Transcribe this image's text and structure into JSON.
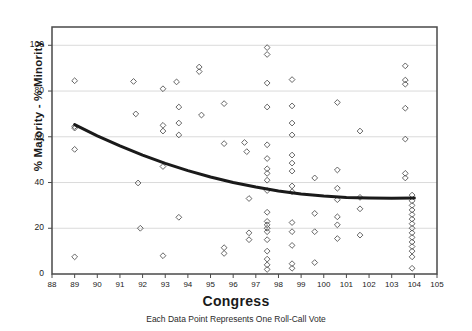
{
  "chart_data": {
    "type": "scatter",
    "title": "",
    "xlabel": "Congress",
    "ylabel": "% Majority - % Minority",
    "caption": "Each Data Point Represents One Roll-Call Vote",
    "xlim": [
      88,
      105
    ],
    "ylim": [
      0,
      108
    ],
    "xticks": [
      88,
      89,
      90,
      91,
      92,
      93,
      94,
      95,
      96,
      97,
      98,
      99,
      100,
      101,
      102,
      103,
      104,
      105
    ],
    "yticks": [
      0,
      20,
      40,
      60,
      80,
      100
    ],
    "grid": "horizontal",
    "legend": "none",
    "marker": "open-diamond",
    "marker_color": "#555555",
    "trend_color": "#1a1a1a",
    "points": [
      [
        89,
        84.5
      ],
      [
        89,
        64.5
      ],
      [
        89,
        63.8
      ],
      [
        89,
        54.5
      ],
      [
        89,
        7.5
      ],
      [
        91.6,
        84.2
      ],
      [
        91.7,
        70.0
      ],
      [
        91.8,
        39.8
      ],
      [
        91.9,
        20.0
      ],
      [
        92.9,
        81.0
      ],
      [
        92.9,
        62.5
      ],
      [
        92.9,
        65.0
      ],
      [
        92.9,
        47.0
      ],
      [
        92.9,
        8.0
      ],
      [
        93.5,
        84.0
      ],
      [
        93.6,
        73.0
      ],
      [
        93.6,
        66.0
      ],
      [
        93.6,
        60.8
      ],
      [
        93.6,
        24.8
      ],
      [
        94.5,
        90.5
      ],
      [
        94.5,
        88.5
      ],
      [
        94.6,
        69.5
      ],
      [
        95.6,
        74.5
      ],
      [
        95.6,
        57.0
      ],
      [
        95.6,
        11.5
      ],
      [
        95.6,
        9.0
      ],
      [
        96.5,
        57.5
      ],
      [
        96.6,
        53.5
      ],
      [
        96.7,
        33.0
      ],
      [
        96.7,
        18.0
      ],
      [
        96.7,
        15.0
      ],
      [
        97.5,
        99.0
      ],
      [
        97.5,
        96.0
      ],
      [
        97.5,
        83.5
      ],
      [
        97.5,
        73.0
      ],
      [
        97.5,
        56.5
      ],
      [
        97.5,
        50.5
      ],
      [
        97.5,
        46.0
      ],
      [
        97.5,
        44.0
      ],
      [
        97.5,
        41.0
      ],
      [
        97.5,
        36.5
      ],
      [
        97.5,
        27.0
      ],
      [
        97.5,
        23.0
      ],
      [
        97.5,
        21.5
      ],
      [
        97.5,
        20.0
      ],
      [
        97.5,
        18.5
      ],
      [
        97.5,
        15.0
      ],
      [
        97.5,
        10.0
      ],
      [
        97.5,
        6.5
      ],
      [
        97.5,
        4.0
      ],
      [
        97.5,
        2.0
      ],
      [
        98.6,
        85.0
      ],
      [
        98.6,
        73.5
      ],
      [
        98.6,
        66.0
      ],
      [
        98.6,
        60.8
      ],
      [
        98.6,
        52.0
      ],
      [
        98.6,
        48.5
      ],
      [
        98.6,
        45.0
      ],
      [
        98.6,
        38.5
      ],
      [
        98.6,
        36.0
      ],
      [
        98.6,
        22.5
      ],
      [
        98.6,
        18.5
      ],
      [
        98.6,
        12.5
      ],
      [
        98.6,
        4.5
      ],
      [
        98.6,
        2.5
      ],
      [
        99.6,
        42.0
      ],
      [
        99.6,
        26.5
      ],
      [
        99.6,
        18.5
      ],
      [
        99.6,
        5.0
      ],
      [
        100.6,
        75.0
      ],
      [
        100.6,
        45.5
      ],
      [
        100.6,
        37.5
      ],
      [
        100.6,
        32.5
      ],
      [
        100.6,
        25.0
      ],
      [
        100.6,
        21.5
      ],
      [
        100.6,
        15.5
      ],
      [
        101.6,
        62.5
      ],
      [
        101.6,
        33.5
      ],
      [
        101.6,
        28.5
      ],
      [
        101.6,
        17.0
      ],
      [
        103.6,
        91.0
      ],
      [
        103.6,
        84.8
      ],
      [
        103.6,
        83.0
      ],
      [
        103.6,
        72.5
      ],
      [
        103.6,
        59.0
      ],
      [
        103.6,
        44.0
      ],
      [
        103.6,
        42.0
      ],
      [
        103.9,
        34.5
      ],
      [
        103.9,
        32.0
      ],
      [
        103.9,
        30.0
      ],
      [
        103.9,
        28.0
      ],
      [
        103.9,
        26.0
      ],
      [
        103.9,
        24.0
      ],
      [
        103.9,
        22.0
      ],
      [
        103.9,
        20.0
      ],
      [
        103.9,
        18.0
      ],
      [
        103.9,
        16.0
      ],
      [
        103.9,
        14.0
      ],
      [
        103.9,
        12.0
      ],
      [
        103.9,
        10.0
      ],
      [
        103.9,
        7.5
      ],
      [
        103.9,
        2.5
      ]
    ],
    "trend_line": [
      [
        89.0,
        65.3
      ],
      [
        90.0,
        60.4
      ],
      [
        91.0,
        56.0
      ],
      [
        92.0,
        52.0
      ],
      [
        93.0,
        48.4
      ],
      [
        94.0,
        45.2
      ],
      [
        95.0,
        42.4
      ],
      [
        96.0,
        40.0
      ],
      [
        97.0,
        38.0
      ],
      [
        98.0,
        36.3
      ],
      [
        99.0,
        35.0
      ],
      [
        100.0,
        34.1
      ],
      [
        101.0,
        33.5
      ],
      [
        102.0,
        33.2
      ],
      [
        103.0,
        33.1
      ],
      [
        104.0,
        33.2
      ]
    ]
  }
}
